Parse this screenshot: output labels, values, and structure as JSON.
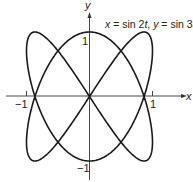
{
  "chart_data": {
    "type": "line",
    "title": "x = sin 2t, y = sin 3t",
    "xlabel": "x",
    "ylabel": "y",
    "xlim": [
      -1.05,
      1.1
    ],
    "ylim": [
      -1.05,
      1.15
    ],
    "xticks": [
      {
        "value": -1,
        "label": "−1"
      },
      {
        "value": 1,
        "label": "1"
      }
    ],
    "yticks": [
      {
        "value": 1,
        "label": "1"
      },
      {
        "value": -1,
        "label": "−1"
      }
    ],
    "grid": false,
    "legend": null,
    "series": [
      {
        "name": "Lissajous curve",
        "parametric": {
          "x": "sin(2t)",
          "y": "sin(3t)",
          "t_range": [
            0,
            6.283185
          ]
        },
        "sample_points": [
          {
            "t": 0,
            "x": 0,
            "y": 0
          },
          {
            "t": 0.5236,
            "x": 0.866,
            "y": 1
          },
          {
            "t": 0.7854,
            "x": 1,
            "y": 0.707
          },
          {
            "t": 1.0472,
            "x": 0.866,
            "y": 0
          },
          {
            "t": 1.5708,
            "x": 0,
            "y": -1
          },
          {
            "t": 2.0944,
            "x": -0.866,
            "y": 0
          },
          {
            "t": 2.3562,
            "x": -1,
            "y": 0.707
          },
          {
            "t": 2.618,
            "x": -0.866,
            "y": 1
          },
          {
            "t": 3.1416,
            "x": 0,
            "y": 0
          },
          {
            "t": 3.6652,
            "x": 0.866,
            "y": -1
          },
          {
            "t": 3.927,
            "x": 1,
            "y": -0.707
          },
          {
            "t": 4.1888,
            "x": 0.866,
            "y": 0
          },
          {
            "t": 4.7124,
            "x": 0,
            "y": 1
          },
          {
            "t": 5.236,
            "x": -0.866,
            "y": 0
          },
          {
            "t": 5.4978,
            "x": -1,
            "y": -0.707
          },
          {
            "t": 5.7596,
            "x": -0.866,
            "y": -1
          },
          {
            "t": 6.2832,
            "x": 0,
            "y": 0
          }
        ],
        "color": "#1a1a1a"
      }
    ]
  },
  "labels": {
    "x_axis": "x",
    "y_axis": "y",
    "formula_x": "x",
    "formula_x_rhs": " = sin 2",
    "formula_t1": "t",
    "formula_sep": ", ",
    "formula_y": "y",
    "formula_y_rhs": " = sin 3",
    "formula_t2": "t",
    "tick_x_neg": "−1",
    "tick_x_pos": "1",
    "tick_y_pos": "1",
    "tick_y_neg": "−1"
  },
  "style": {
    "curve_color": "#1a1a1a",
    "axis_color": "#333333",
    "background": "#ffffff"
  }
}
